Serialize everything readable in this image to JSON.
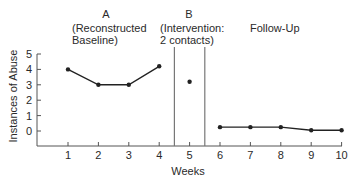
{
  "chart_data": {
    "type": "line",
    "title": "",
    "xlabel": "Weeks",
    "ylabel": "Instances of Abuse",
    "x": [
      1,
      2,
      3,
      4,
      5,
      6,
      7,
      8,
      9,
      10
    ],
    "x_ticks": [
      "1",
      "2",
      "3",
      "4",
      "5",
      "6",
      "7",
      "8",
      "9",
      "10"
    ],
    "y_ticks": [
      "0",
      "1",
      "2",
      "3",
      "4",
      "5"
    ],
    "ylim": [
      -1,
      5
    ],
    "xlim": [
      0,
      10
    ],
    "grid": false,
    "phases": [
      {
        "id": "A",
        "letter": "A",
        "line1": "(Reconstructed",
        "line2": "Baseline)",
        "weeks": [
          1,
          2,
          3,
          4
        ]
      },
      {
        "id": "B",
        "letter": "B",
        "line1": "(Intervention:",
        "line2": "2 contacts)",
        "weeks": [
          5
        ]
      },
      {
        "id": "F",
        "letter": "",
        "line1": "Follow-Up",
        "line2": "",
        "weeks": [
          6,
          7,
          8,
          9,
          10
        ]
      }
    ],
    "phase_change_lines_at": [
      4.5,
      5.5
    ],
    "series": [
      {
        "name": "Baseline",
        "x": [
          1,
          2,
          3,
          4
        ],
        "values": [
          4.0,
          3.0,
          3.0,
          4.2
        ],
        "connected": true
      },
      {
        "name": "Intervention",
        "x": [
          5
        ],
        "values": [
          3.2
        ],
        "connected": false
      },
      {
        "name": "Follow-Up",
        "x": [
          6,
          7,
          8,
          9,
          10
        ],
        "values": [
          0.25,
          0.25,
          0.25,
          0.05,
          0.05
        ],
        "connected": true
      }
    ]
  },
  "colors": {
    "line": "#222222",
    "axis": "#555555",
    "phase_line": "#777777"
  }
}
